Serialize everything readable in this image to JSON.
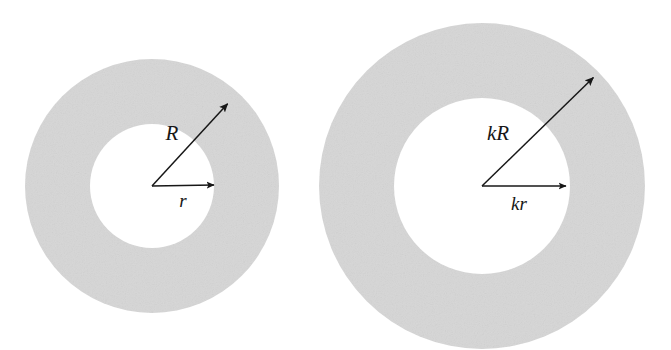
{
  "figure": {
    "background_color": "#ffffff",
    "ring_fill_color": "#d6d6d6",
    "stroke_color": "#171717",
    "panels": [
      {
        "id": "left-annulus",
        "name": "original-annulus",
        "center": {
          "x": 152,
          "y": 186
        },
        "outer_radius": 127,
        "inner_radius": 62,
        "arrows": [
          {
            "id": "inner-radius-arrow",
            "label": "r",
            "label_position": {
              "x": 183,
              "y": 207
            },
            "from": {
              "x": 152,
              "y": 186
            },
            "to": {
              "x": 218,
              "y": 185
            },
            "font_size": 19
          },
          {
            "id": "outer-radius-arrow",
            "label": "R",
            "label_position": {
              "x": 172,
              "y": 140
            },
            "from": {
              "x": 152,
              "y": 186
            },
            "to": {
              "x": 231,
              "y": 100
            },
            "font_size": 21
          }
        ]
      },
      {
        "id": "right-annulus",
        "name": "scaled-annulus",
        "center": {
          "x": 482,
          "y": 186
        },
        "outer_radius": 163,
        "inner_radius": 88,
        "arrows": [
          {
            "id": "inner-radius-arrow",
            "label": "kr",
            "label_position": {
              "x": 519,
              "y": 210
            },
            "from": {
              "x": 482,
              "y": 186
            },
            "to": {
              "x": 570,
              "y": 186
            },
            "font_size": 19
          },
          {
            "id": "outer-radius-arrow",
            "label": "kR",
            "label_position": {
              "x": 498,
              "y": 140
            },
            "from": {
              "x": 482,
              "y": 186
            },
            "to": {
              "x": 597,
              "y": 74
            },
            "font_size": 21
          }
        ]
      }
    ]
  }
}
